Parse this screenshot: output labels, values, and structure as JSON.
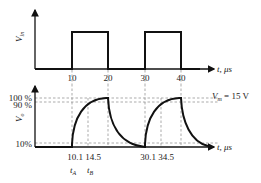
{
  "diagram": {
    "top_plot": {
      "ylabel": "V",
      "ylabel_sub": "in",
      "xlabel": "t, μs",
      "pulses": [
        {
          "start": 10,
          "end": 20
        },
        {
          "start": 30,
          "end": 40
        }
      ],
      "ticks": [
        "10",
        "20",
        "30",
        "40"
      ]
    },
    "bottom_plot": {
      "ylabel": "V",
      "ylabel_sub": "o",
      "xlabel": "t, μs",
      "annotation": "V",
      "annotation_sub": "m",
      "annotation_value": " = 15 V",
      "levels": [
        "100 %",
        "90 %",
        "10%"
      ],
      "ticks": [
        "10.1",
        "14.5",
        "30.1",
        "34.5"
      ],
      "markers": [
        {
          "label": "t",
          "sub": "A"
        },
        {
          "label": "t",
          "sub": "B"
        }
      ]
    }
  }
}
